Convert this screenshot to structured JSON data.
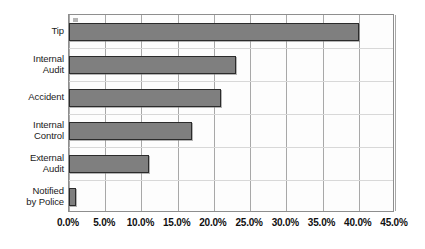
{
  "chart_data": {
    "type": "bar",
    "orientation": "horizontal",
    "title": "",
    "xlabel": "",
    "ylabel": "",
    "categories": [
      "Tip",
      "Internal Audit",
      "Accident",
      "Internal Control",
      "External Audit",
      "Notified by Police"
    ],
    "category_lines": [
      [
        "Tip"
      ],
      [
        "Internal",
        "Audit"
      ],
      [
        "Accident"
      ],
      [
        "Internal",
        "Control"
      ],
      [
        "External",
        "Audit"
      ],
      [
        "Notified",
        "by Police"
      ]
    ],
    "values": [
      40.0,
      23.0,
      21.0,
      17.0,
      11.0,
      1.0
    ],
    "value_unit": "%",
    "xlim": [
      0,
      45
    ],
    "xticks": [
      0,
      5,
      10,
      15,
      20,
      25,
      30,
      35,
      40,
      45
    ],
    "xtick_labels": [
      "0.0%",
      "5.0%",
      "10.0%",
      "15.0%",
      "20.0%",
      "25.0%",
      "30.0%",
      "35.0%",
      "40.0%",
      "45.0%"
    ],
    "grid": "vertical",
    "legend": "none",
    "bar_color": "#7f7f7f",
    "bar_border_color": "#2b2b2b",
    "plot_background": "#fdfdfd",
    "plot_border_color": "#8e8e8e"
  }
}
